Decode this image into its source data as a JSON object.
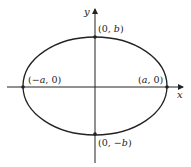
{
  "diagram": {
    "type": "ellipse",
    "axes": {
      "x_label": "x",
      "y_label": "y"
    },
    "points": {
      "top": "(0, b)",
      "bottom": "(0, −b)",
      "left": "(−a, 0)",
      "right": "(a, 0)"
    },
    "colors": {
      "stroke": "#222222",
      "background": "#ffffff"
    }
  }
}
